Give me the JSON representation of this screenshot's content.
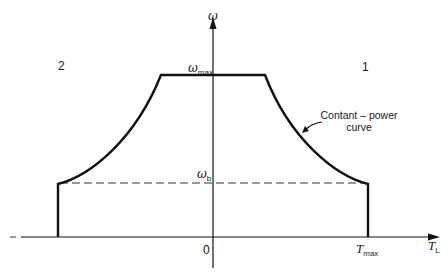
{
  "diagram": {
    "type": "torque-speed operating envelope",
    "colors": {
      "line": "#111111",
      "background": "#ffffff"
    },
    "axes": {
      "y": {
        "label": "ω"
      },
      "x": {
        "label": "T",
        "label_sub": "L"
      },
      "origin": "0"
    },
    "levels": {
      "omega_max": {
        "symbol": "ω",
        "sub": "max"
      },
      "omega_b": {
        "symbol": "ω",
        "sub": "b"
      },
      "t_max": {
        "symbol": "T",
        "sub": "max"
      }
    },
    "quadrants": {
      "q1": "1",
      "q2": "2"
    },
    "annotation": {
      "line1": "Contant – power",
      "line2": "curve"
    }
  }
}
